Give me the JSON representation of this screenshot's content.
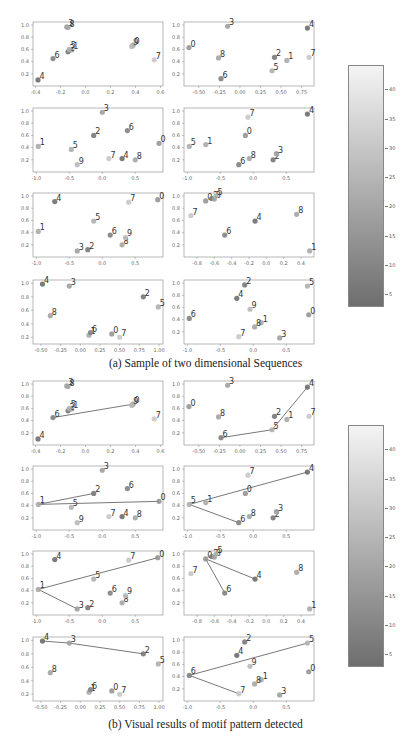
{
  "figure": {
    "caption_a": "(a) Sample of two dimensional Sequences",
    "caption_b": "(b) Visual results of motif pattern detected",
    "colorbar": {
      "ticks": [
        "5",
        "10",
        "15",
        "20",
        "25",
        "30",
        "35",
        "40"
      ],
      "range": [
        3,
        44
      ],
      "colors": {
        "high": "#f4f4f4",
        "low": "#6e6e6e"
      }
    }
  },
  "chart_data": [
    {
      "type": "scatter",
      "title": "(a) Sample of two dimensional Sequences",
      "panels": [
        {
          "id": "a1",
          "xlim": [
            -0.42,
            0.62
          ],
          "ylim": [
            0,
            1.05
          ],
          "xticks": [
            "-0.4",
            "-0.2",
            "0.0",
            "0.2",
            "0.4",
            "0.6"
          ],
          "yticks": [
            "0.2",
            "0.4",
            "0.6",
            "0.8",
            "1.0"
          ],
          "points": [
            {
              "label": "0",
              "x": 0.38,
              "y": 0.67
            },
            {
              "label": "1",
              "x": -0.11,
              "y": 0.59
            },
            {
              "label": "2",
              "x": -0.14,
              "y": 0.56
            },
            {
              "label": "3",
              "x": -0.15,
              "y": 0.97
            },
            {
              "label": "4",
              "x": -0.38,
              "y": 0.1
            },
            {
              "label": "5",
              "x": -0.13,
              "y": 0.6
            },
            {
              "label": "6",
              "x": -0.26,
              "y": 0.45
            },
            {
              "label": "7",
              "x": 0.55,
              "y": 0.43
            },
            {
              "label": "8",
              "x": -0.14,
              "y": 0.96
            },
            {
              "label": "9",
              "x": 0.37,
              "y": 0.65
            }
          ]
        },
        {
          "id": "a2",
          "xlim": [
            -0.68,
            0.9
          ],
          "ylim": [
            0,
            1.05
          ],
          "xticks": [
            "-0.50",
            "-0.25",
            "0.00",
            "0.25",
            "0.50",
            "0.75"
          ],
          "yticks": [
            "0.2",
            "0.4",
            "0.6",
            "0.8",
            "1.0"
          ],
          "points": [
            {
              "label": "0",
              "x": -0.62,
              "y": 0.63
            },
            {
              "label": "1",
              "x": 0.57,
              "y": 0.42
            },
            {
              "label": "2",
              "x": 0.42,
              "y": 0.47
            },
            {
              "label": "3",
              "x": -0.15,
              "y": 0.98
            },
            {
              "label": "4",
              "x": 0.82,
              "y": 0.95
            },
            {
              "label": "5",
              "x": 0.39,
              "y": 0.25
            },
            {
              "label": "6",
              "x": -0.23,
              "y": 0.12
            },
            {
              "label": "7",
              "x": 0.84,
              "y": 0.47
            },
            {
              "label": "8",
              "x": -0.26,
              "y": 0.46
            }
          ]
        },
        {
          "id": "a3",
          "xlim": [
            -1.05,
            0.92
          ],
          "ylim": [
            0,
            1.05
          ],
          "xticks": [
            "-1.0",
            "-0.5",
            "0.0",
            "0.5"
          ],
          "yticks": [
            "0.2",
            "0.4",
            "0.6",
            "0.8",
            "1.0"
          ],
          "points": [
            {
              "label": "0",
              "x": 0.86,
              "y": 0.47
            },
            {
              "label": "1",
              "x": -0.97,
              "y": 0.42
            },
            {
              "label": "2",
              "x": -0.13,
              "y": 0.6
            },
            {
              "label": "3",
              "x": 0,
              "y": 0.98
            },
            {
              "label": "4",
              "x": 0.3,
              "y": 0.22
            },
            {
              "label": "5",
              "x": -0.47,
              "y": 0.37
            },
            {
              "label": "6",
              "x": 0.38,
              "y": 0.68
            },
            {
              "label": "7",
              "x": 0.1,
              "y": 0.22
            },
            {
              "label": "8",
              "x": 0.5,
              "y": 0.2
            },
            {
              "label": "9",
              "x": -0.38,
              "y": 0.12
            }
          ]
        },
        {
          "id": "a4",
          "xlim": [
            -1.05,
            0.92
          ],
          "ylim": [
            0,
            1.05
          ],
          "xticks": [
            "-1.0",
            "-0.5",
            "0.0",
            "0.5"
          ],
          "yticks": [
            "0.2",
            "0.4",
            "0.6",
            "0.8",
            "1.0"
          ],
          "points": [
            {
              "label": "0",
              "x": -0.12,
              "y": 0.6
            },
            {
              "label": "1",
              "x": -0.72,
              "y": 0.45
            },
            {
              "label": "2",
              "x": 0.3,
              "y": 0.2
            },
            {
              "label": "3",
              "x": 0.35,
              "y": 0.3
            },
            {
              "label": "4",
              "x": 0.82,
              "y": 0.95
            },
            {
              "label": "5",
              "x": -0.97,
              "y": 0.42
            },
            {
              "label": "6",
              "x": -0.22,
              "y": 0.12
            },
            {
              "label": "7",
              "x": -0.08,
              "y": 0.9
            },
            {
              "label": "8",
              "x": -0.06,
              "y": 0.22
            }
          ]
        },
        {
          "id": "a5",
          "xlim": [
            -1.05,
            0.92
          ],
          "ylim": [
            0,
            1.05
          ],
          "xticks": [
            "-1.0",
            "-0.5",
            "0.0",
            "0.5"
          ],
          "yticks": [
            "0.2",
            "0.4",
            "0.6",
            "0.8",
            "1.0"
          ],
          "points": [
            {
              "label": "0",
              "x": 0.84,
              "y": 0.94
            },
            {
              "label": "1",
              "x": -0.97,
              "y": 0.42
            },
            {
              "label": "2",
              "x": -0.22,
              "y": 0.12
            },
            {
              "label": "3",
              "x": -0.38,
              "y": 0.1
            },
            {
              "label": "4",
              "x": -0.72,
              "y": 0.91
            },
            {
              "label": "5",
              "x": -0.13,
              "y": 0.59
            },
            {
              "label": "6",
              "x": 0.12,
              "y": 0.36
            },
            {
              "label": "7",
              "x": 0.4,
              "y": 0.9
            },
            {
              "label": "8",
              "x": 0.3,
              "y": 0.2
            },
            {
              "label": "9",
              "x": 0.35,
              "y": 0.32
            }
          ]
        },
        {
          "id": "a6",
          "xlim": [
            -0.95,
            0.55
          ],
          "ylim": [
            0,
            1.05
          ],
          "xticks": [
            "-0.8",
            "-0.6",
            "-0.4",
            "-0.2",
            "0.0",
            "0.2",
            "0.4"
          ],
          "yticks": [
            "0.2",
            "0.4",
            "0.6",
            "0.8",
            "1.0"
          ],
          "points": [
            {
              "label": "0",
              "x": -0.7,
              "y": 0.92
            },
            {
              "label": "1",
              "x": 0.5,
              "y": 0.1
            },
            {
              "label": "2",
              "x": -0.63,
              "y": 0.96
            },
            {
              "label": "3",
              "x": -0.6,
              "y": 0.95
            },
            {
              "label": "4",
              "x": -0.13,
              "y": 0.59
            },
            {
              "label": "5",
              "x": -0.58,
              "y": 1.0
            },
            {
              "label": "6",
              "x": -0.48,
              "y": 0.36
            },
            {
              "label": "7",
              "x": -0.87,
              "y": 0.68
            },
            {
              "label": "8",
              "x": 0.35,
              "y": 0.7
            }
          ]
        },
        {
          "id": "a7",
          "xlim": [
            -0.6,
            1.05
          ],
          "ylim": [
            0.1,
            1.05
          ],
          "xticks": [
            "-0.50",
            "-0.25",
            "0.00",
            "0.25",
            "0.50",
            "0.75",
            "1.00"
          ],
          "yticks": [
            "0.2",
            "0.4",
            "0.6",
            "0.8",
            "1.0"
          ],
          "points": [
            {
              "label": "0",
              "x": 0.4,
              "y": 0.25
            },
            {
              "label": "1",
              "x": 0.11,
              "y": 0.23
            },
            {
              "label": "2",
              "x": 0.8,
              "y": 0.8
            },
            {
              "label": "3",
              "x": -0.14,
              "y": 0.96
            },
            {
              "label": "4",
              "x": -0.48,
              "y": 0.99
            },
            {
              "label": "5",
              "x": 0.99,
              "y": 0.65
            },
            {
              "label": "6",
              "x": 0.13,
              "y": 0.27
            },
            {
              "label": "7",
              "x": 0.5,
              "y": 0.2
            },
            {
              "label": "8",
              "x": -0.38,
              "y": 0.52
            }
          ]
        },
        {
          "id": "a8",
          "xlim": [
            -1.05,
            0.92
          ],
          "ylim": [
            0,
            1.05
          ],
          "xticks": [
            "-1.0",
            "-0.5",
            "0.0",
            "0.5"
          ],
          "yticks": [
            "0.2",
            "0.4",
            "0.6",
            "0.8",
            "1.0"
          ],
          "points": [
            {
              "label": "0",
              "x": 0.84,
              "y": 0.48
            },
            {
              "label": "1",
              "x": 0.12,
              "y": 0.35
            },
            {
              "label": "2",
              "x": -0.13,
              "y": 0.97
            },
            {
              "label": "3",
              "x": 0.4,
              "y": 0.1
            },
            {
              "label": "4",
              "x": -0.25,
              "y": 0.75
            },
            {
              "label": "5",
              "x": 0.82,
              "y": 0.95
            },
            {
              "label": "6",
              "x": -0.97,
              "y": 0.42
            },
            {
              "label": "7",
              "x": -0.22,
              "y": 0.12
            },
            {
              "label": "8",
              "x": 0.02,
              "y": 0.28
            },
            {
              "label": "9",
              "x": -0.05,
              "y": 0.57
            }
          ]
        }
      ]
    },
    {
      "type": "line",
      "title": "(b) Visual results of motif pattern detected",
      "panels": [
        {
          "id": "b1",
          "motif": [
            "6",
            "5"
          ],
          "path": [
            [
              -0.26,
              0.45
            ],
            [
              0.38,
              0.67
            ]
          ]
        },
        {
          "id": "b2",
          "motif": [
            "6",
            "5",
            "4"
          ],
          "path": [
            [
              -0.23,
              0.12
            ],
            [
              0.39,
              0.25
            ],
            [
              0.82,
              0.95
            ]
          ]
        },
        {
          "id": "b3",
          "motif": [
            "2",
            "1",
            "0"
          ],
          "path": [
            [
              -0.13,
              0.6
            ],
            [
              -0.97,
              0.42
            ],
            [
              0.86,
              0.47
            ]
          ]
        },
        {
          "id": "b4",
          "motif": [
            "4",
            "5",
            "6"
          ],
          "path": [
            [
              0.82,
              0.95
            ],
            [
              -0.97,
              0.42
            ],
            [
              -0.22,
              0.12
            ]
          ]
        },
        {
          "id": "b5",
          "motif": [
            "0",
            "1",
            "3"
          ],
          "path": [
            [
              0.84,
              0.94
            ],
            [
              -0.97,
              0.42
            ],
            [
              -0.38,
              0.1
            ]
          ]
        },
        {
          "id": "b6",
          "motif": [
            "4",
            "0",
            "6"
          ],
          "path": [
            [
              -0.13,
              0.59
            ],
            [
              -0.7,
              0.92
            ],
            [
              -0.48,
              0.36
            ]
          ]
        },
        {
          "id": "b7",
          "motif": [
            "4",
            "3",
            "2"
          ],
          "path": [
            [
              -0.48,
              0.99
            ],
            [
              -0.14,
              0.96
            ],
            [
              0.8,
              0.8
            ]
          ]
        },
        {
          "id": "b8",
          "motif": [
            "5",
            "6",
            "7"
          ],
          "path": [
            [
              0.82,
              0.95
            ],
            [
              -0.97,
              0.42
            ],
            [
              -0.22,
              0.12
            ]
          ]
        }
      ],
      "line_color": "#555555"
    }
  ]
}
